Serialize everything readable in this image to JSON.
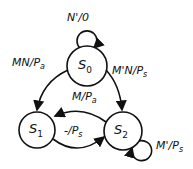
{
  "diagram": {
    "type": "state-machine",
    "states": [
      {
        "id": "S0",
        "name": "S",
        "sub": "0"
      },
      {
        "id": "S1",
        "name": "S",
        "sub": "1"
      },
      {
        "id": "S2",
        "name": "S",
        "sub": "2"
      }
    ],
    "transitions": [
      {
        "from": "S0",
        "to": "S0",
        "input": "N'",
        "sep": "/",
        "output": "0"
      },
      {
        "from": "S0",
        "to": "S1",
        "input": "MN",
        "sep": "/",
        "output": "P",
        "output_sub": "a"
      },
      {
        "from": "S0",
        "to": "S2",
        "input": "M'N",
        "sep": "/",
        "output": "P",
        "output_sub": "s"
      },
      {
        "from": "S2",
        "to": "S1",
        "input": "M",
        "sep": "/",
        "output": "P",
        "output_sub": "a"
      },
      {
        "from": "S1",
        "to": "S2",
        "input": "-",
        "sep": "/",
        "output": "P",
        "output_sub": "s"
      },
      {
        "from": "S2",
        "to": "S2",
        "input": "M'",
        "sep": "/",
        "output": "P",
        "output_sub": "s"
      }
    ],
    "colors": {
      "stroke": "#111111",
      "background": "#ffffff"
    }
  }
}
